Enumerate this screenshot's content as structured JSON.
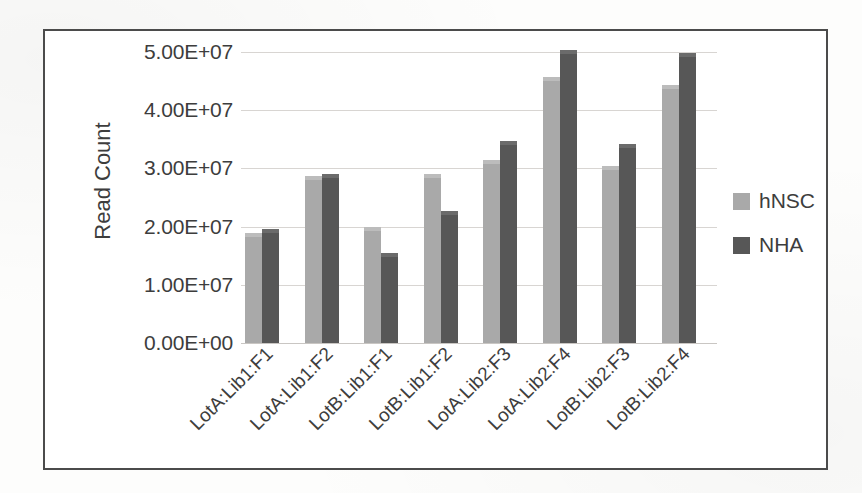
{
  "chart_data": {
    "type": "bar",
    "title": "",
    "xlabel": "",
    "ylabel": "Read Count",
    "ylim": [
      0,
      50000000
    ],
    "ytick_values": [
      0,
      10000000,
      20000000,
      30000000,
      40000000,
      50000000
    ],
    "ytick_labels": [
      "0.00E+00",
      "1.00E+07",
      "2.00E+07",
      "3.00E+07",
      "4.00E+07",
      "5.00E+07"
    ],
    "grid": true,
    "legend_position": "right",
    "categories": [
      "LotA:Lib1:F1",
      "LotA:Lib1:F2",
      "LotB:Lib1:F1",
      "LotB:Lib1:F2",
      "LotA:Lib2:F3",
      "LotA:Lib2:F4",
      "LotB:Lib2:F3",
      "LotB:Lib2:F4"
    ],
    "series": [
      {
        "name": "hNSC",
        "color": "#a9a9a9",
        "values": [
          18900000,
          28700000,
          19900000,
          29000000,
          31500000,
          45700000,
          30400000,
          44300000
        ]
      },
      {
        "name": "NHA",
        "color": "#575757",
        "values": [
          19600000,
          29000000,
          15500000,
          22600000,
          34700000,
          50300000,
          34200000,
          49800000
        ]
      }
    ]
  },
  "legend": {
    "items": [
      {
        "label": "hNSC",
        "color": "#a9a9a9"
      },
      {
        "label": "NHA",
        "color": "#575757"
      }
    ]
  }
}
